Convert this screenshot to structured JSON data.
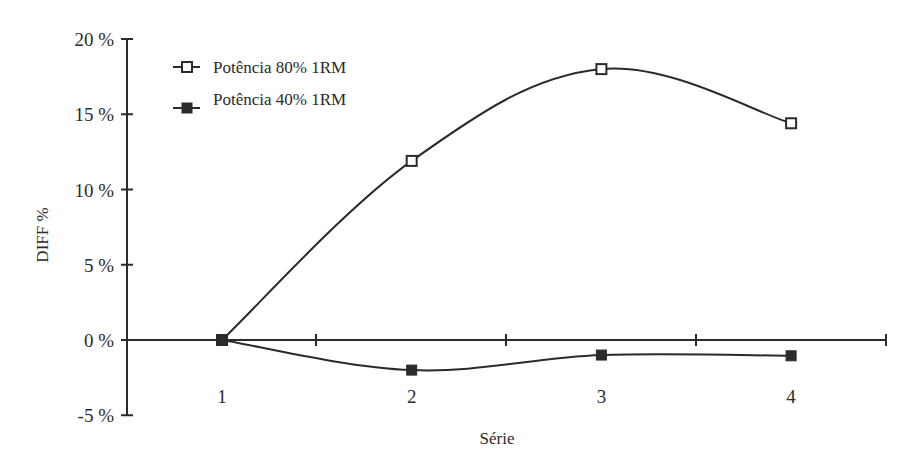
{
  "chart_data": {
    "type": "line",
    "title": "",
    "xlabel": "Série",
    "ylabel": "DIFF %",
    "categories": [
      "1",
      "2",
      "3",
      "4"
    ],
    "x": [
      1,
      2,
      3,
      4
    ],
    "series": [
      {
        "name": "Potência 80% 1RM",
        "marker": "open-square",
        "values": [
          0,
          11.9,
          18.0,
          14.4
        ]
      },
      {
        "name": "Potência 40% 1RM",
        "marker": "filled-square",
        "values": [
          0,
          -2.0,
          -1.0,
          -1.05
        ]
      }
    ],
    "ylim": [
      -5,
      20
    ],
    "yticks": [
      -5,
      0,
      5,
      10,
      15,
      20
    ],
    "ytick_labels": [
      "-5 %",
      "0 %",
      "5 %",
      "10 %",
      "15 %",
      "20 %"
    ],
    "xlim": [
      0.5,
      4.5
    ],
    "smooth": true,
    "grid": false,
    "legend_position": "top-left"
  },
  "colors": {
    "line": "#2b2b2b",
    "background": "#ffffff"
  },
  "legend": {
    "items": [
      {
        "label": "Potência 80% 1RM",
        "icon": "open-square-marker-icon"
      },
      {
        "label": "Potência 40% 1RM",
        "icon": "filled-square-marker-icon"
      }
    ]
  }
}
